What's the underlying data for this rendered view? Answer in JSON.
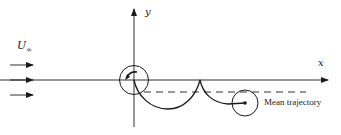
{
  "figure": {
    "type": "flow trajectory diagram",
    "colors": {
      "ink": "#1a1a1a",
      "background": "#ffffff"
    },
    "labels": {
      "freestream_symbol": "U",
      "freestream_subscript": "∞",
      "y_axis": "y",
      "x_axis": "x",
      "mean_trajectory": "Mean trajectory"
    },
    "elements": {
      "freestream_arrows": 3,
      "start_circle": "circle centered at origin with small curved arrow indicating rotation",
      "trajectory": "trochoidal path with cusp touching x-axis",
      "mean_trajectory_line": "dashed horizontal line below x-axis",
      "end_circle": "circle with dot at trajectory end point"
    }
  }
}
